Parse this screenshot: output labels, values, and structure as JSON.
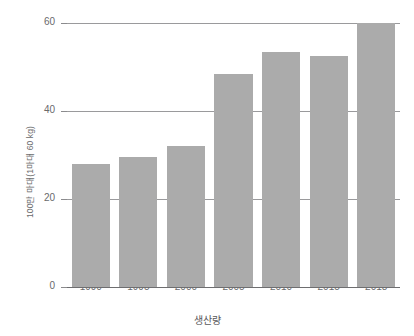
{
  "chart_data": {
    "type": "bar",
    "title": "",
    "title_fragment_note": "top title row is cropped off by the image edge and illegible",
    "categories": [
      "1990",
      "1995",
      "2000",
      "2005",
      "2010",
      "2015",
      "2018"
    ],
    "values": [
      28,
      29.5,
      32,
      48.5,
      53.5,
      52.5,
      60
    ],
    "series": [
      {
        "name": "생산량",
        "values": [
          28,
          29.5,
          32,
          48.5,
          53.5,
          52.5,
          60
        ]
      }
    ],
    "xlabel": "생산량",
    "ylabel": "100만 마대(1마대 60 kg)",
    "ylim": [
      0,
      63
    ],
    "yticks": [
      0,
      20,
      40,
      60
    ],
    "ytick_labels": [
      "0",
      "20",
      "40",
      "60"
    ],
    "xtick_labels": [
      "1990",
      "1995",
      "2000",
      "2005",
      "2010",
      "2015",
      "2018"
    ],
    "grid": true,
    "grid_axis": "y",
    "legend": false,
    "bar_color": "#ababab",
    "background_color": "#ffffff",
    "axis_color": "#6e6e70",
    "text_color": "#6a6a6c"
  }
}
